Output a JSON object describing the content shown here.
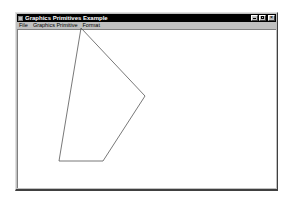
{
  "window": {
    "title": "Graphics Primitives Example",
    "buttons": [
      "minimize",
      "maximize",
      "close"
    ]
  },
  "menubar": {
    "items": [
      {
        "label": "File"
      },
      {
        "label": "Graphics Primitive"
      },
      {
        "label": "Format"
      }
    ]
  },
  "canvas": {
    "shape": "polygon",
    "stroke_color": "#555555",
    "fill": "none",
    "points": [
      [
        81,
        28
      ],
      [
        145,
        96
      ],
      [
        103,
        161
      ],
      [
        59,
        161
      ]
    ]
  }
}
